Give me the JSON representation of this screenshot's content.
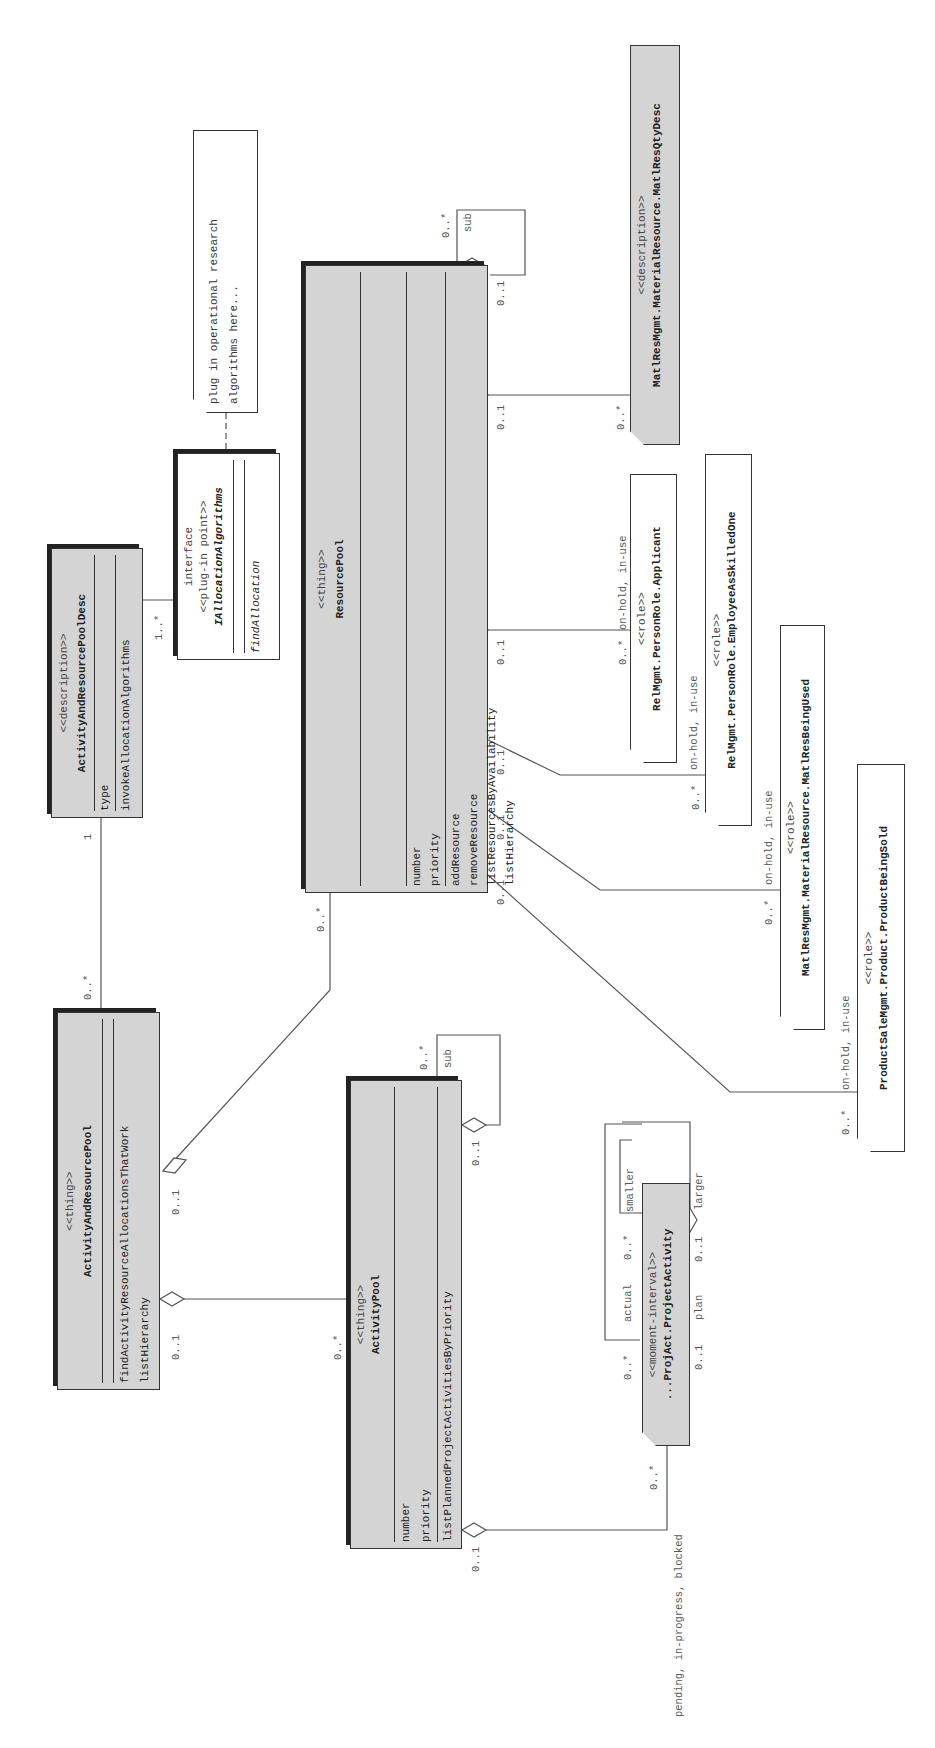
{
  "classes": {
    "activity_and_resource_pool": {
      "stereotype": "<<thing>>",
      "name": "ActivityAndResourcePool",
      "attributes": [],
      "operations": [
        "findActivityResourceAllocationsThatWork",
        "listHierarchy"
      ]
    },
    "activity_and_resource_pool_desc": {
      "stereotype": "<<description>>",
      "name": "ActivityAndResourcePoolDesc",
      "attributes": [
        "type"
      ],
      "operations": [
        "invokeAllocationAlgorithms"
      ]
    },
    "i_allocation_algorithms": {
      "label": "interface",
      "stereotype": "<<plug-in point>>",
      "name": "IAllocationAlgorithms",
      "operations": [
        "findAllocation"
      ]
    },
    "note": {
      "line1": "plug in operational research",
      "line2": "algorithms here..."
    },
    "resource_pool": {
      "stereotype": "<<thing>>",
      "name": "ResourcePool",
      "attributes": [
        "number",
        "priority"
      ],
      "operations": [
        "addResource",
        "removeResource",
        "listResourcesByAvailability",
        "listHierarchy"
      ]
    },
    "activity_pool": {
      "stereotype": "<<thing>>",
      "name": "ActivityPool",
      "attributes": [
        "number",
        "priority"
      ],
      "operations": [
        "listPlannedProjectActivitiesByPriority"
      ]
    },
    "project_activity": {
      "stereotype": "<<moment-interval>>",
      "name": "...ProjAct.ProjectActivity"
    },
    "matl_res_qty_desc": {
      "stereotype": "<<description>>",
      "name": "MatlResMgmt.MaterialResource.MatlResQtyDesc"
    },
    "applicant": {
      "stereotype": "<<role>>",
      "name": "RelMgmt.PersonRole.Applicant"
    },
    "employee_as_skilled_one": {
      "stereotype": "<<role>>",
      "name": "RelMgmt.PersonRole.EmployeeAsSkilledOne"
    },
    "matl_res_being_used": {
      "stereotype": "<<role>>",
      "name": "MatlResMgmt.MaterialResource.MatlResBeingUsed"
    },
    "product_being_sold": {
      "stereotype": "<<role>>",
      "name": "ProductSaleMgmt.Product.ProductBeingSold"
    }
  },
  "labels": {
    "m_arp_desc_0n": "0..*",
    "m_desc_1": "1",
    "m_desc_iface": "1..*",
    "m_arp_rp_01": "0..1",
    "m_rp_0n": "0..*",
    "m_arp_ap_01": "0..1",
    "m_ap_0n": "0..*",
    "m_ap_sub_0n": "0..*",
    "r_ap_sub": "sub",
    "m_ap_sub_01": "0..1",
    "m_ap_pa_01": "0..1",
    "m_pa_0n": "0..*",
    "r_pa_states": "pending, in-progress, blocked",
    "m_pa_actual_0n": "0..*",
    "r_actual": "actual",
    "m_pa_smaller_0n": "0..*",
    "r_smaller": "smaller",
    "m_pa_plan_01": "0..1",
    "r_plan": "plan",
    "m_pa_larger_01": "0..1",
    "r_larger": "larger",
    "m_rp_sub_0n": "0..*",
    "r_rp_sub": "sub",
    "m_rp_sub_01": "0..1",
    "m_rp_desc_01": "0..1",
    "m_desc_0n": "0..*",
    "m_rp_app_01": "0..1",
    "m_app_0n": "0..*",
    "r_app_states": "on-hold, in-use",
    "m_rp_emp_01": "0..1",
    "m_emp_0n": "0..*",
    "r_emp_states": "on-hold, in-use",
    "m_rp_mat_01": "0..1",
    "m_mat_0n": "0..*",
    "r_mat_states": "on-hold, in-use",
    "m_rp_prod_01": "0..1",
    "m_prod_0n": "0..*",
    "r_prod_states": "on-hold, in-use"
  },
  "colors": {
    "class_fill": "#d4d4d4",
    "role_fill": "#ffffff",
    "line": "#555555"
  }
}
